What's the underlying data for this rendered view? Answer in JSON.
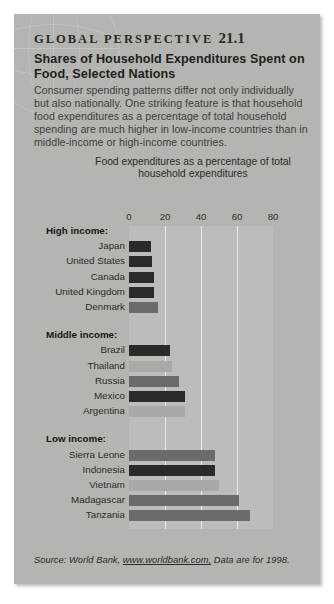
{
  "box": {
    "kicker": "GLOBAL  PERSPECTIVE",
    "number": "21.1",
    "title": "Shares of Household Expenditures Spent on Food, Selected Nations",
    "intro": "Consumer spending patterns differ not only individually but also nationally. One striking feature is that household food expenditures as a percentage of total household spending are much higher in low-income countries than in middle-income or high-income countries.",
    "source_prefix": "Source: World Bank, ",
    "source_link": "www.worldbank.com,",
    "source_suffix": " Data are for 1998."
  },
  "colors": {
    "card_bg": "#b4b4b0",
    "plot_bg": "#bcbcb8",
    "gridline": "#e9e9e6",
    "bar_dark": "#2a2a2a",
    "bar_mid": "#6b6b68",
    "bar_light": "#a9a9a5",
    "text": "#2b2b2b"
  },
  "chart_data": {
    "type": "bar",
    "orientation": "horizontal",
    "title": "Food expenditures as a percentage of total household expenditures",
    "xlabel": "",
    "ylabel": "",
    "xlim": [
      0,
      80
    ],
    "ticks": [
      0,
      20,
      40,
      60,
      80
    ],
    "grid": true,
    "legend": "none",
    "groups": [
      {
        "label": "High income:",
        "items": [
          {
            "country": "Japan",
            "value": 12,
            "shade": "dark"
          },
          {
            "country": "United States",
            "value": 13,
            "shade": "dark"
          },
          {
            "country": "Canada",
            "value": 14,
            "shade": "dark"
          },
          {
            "country": "United Kingdom",
            "value": 14,
            "shade": "dark"
          },
          {
            "country": "Denmark",
            "value": 16,
            "shade": "mid"
          }
        ]
      },
      {
        "label": "Middle income:",
        "items": [
          {
            "country": "Brazil",
            "value": 23,
            "shade": "dark"
          },
          {
            "country": "Thailand",
            "value": 24,
            "shade": "light"
          },
          {
            "country": "Russia",
            "value": 28,
            "shade": "mid"
          },
          {
            "country": "Mexico",
            "value": 31,
            "shade": "dark"
          },
          {
            "country": "Argentina",
            "value": 31,
            "shade": "light"
          }
        ]
      },
      {
        "label": "Low income:",
        "items": [
          {
            "country": "Sierra Leone",
            "value": 48,
            "shade": "mid"
          },
          {
            "country": "Indonesia",
            "value": 48,
            "shade": "dark"
          },
          {
            "country": "Vietnam",
            "value": 50,
            "shade": "light"
          },
          {
            "country": "Madagascar",
            "value": 61,
            "shade": "mid"
          },
          {
            "country": "Tanzania",
            "value": 67,
            "shade": "mid"
          }
        ]
      }
    ]
  }
}
